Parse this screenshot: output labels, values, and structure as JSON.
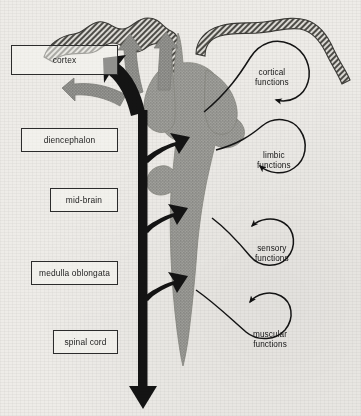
{
  "diagram": {
    "background_color": "#eeece8",
    "ink_color": "#1d1d1d",
    "grey_fill": "#9a9a96",
    "hatch_color": "#55544f"
  },
  "structure_labels": [
    {
      "id": "cortex",
      "text": "cortex",
      "x": 11,
      "y": 45,
      "w": 107,
      "h": 30
    },
    {
      "id": "diencephalon",
      "text": "diencephalon",
      "x": 21,
      "y": 128,
      "w": 97,
      "h": 24
    },
    {
      "id": "midbrain",
      "text": "mid-brain",
      "x": 50,
      "y": 188,
      "w": 68,
      "h": 24
    },
    {
      "id": "medulla-oblongata",
      "text": "medulla oblongata",
      "x": 31,
      "y": 261,
      "w": 87,
      "h": 24
    },
    {
      "id": "spinal-cord",
      "text": "spinal cord",
      "x": 53,
      "y": 330,
      "w": 65,
      "h": 24
    }
  ],
  "function_labels": [
    {
      "id": "cortical",
      "line1": "cortical",
      "line2": "functions",
      "x": 255,
      "y": 68
    },
    {
      "id": "limbic",
      "line1": "limbic",
      "line2": "functions",
      "x": 257,
      "y": 151
    },
    {
      "id": "sensory",
      "line1": "sensory",
      "line2": "functions",
      "x": 255,
      "y": 244
    },
    {
      "id": "muscular",
      "line1": "muscular",
      "line2": "functions",
      "x": 253,
      "y": 330
    }
  ],
  "flow_arrows": {
    "ascending_trunk": "black vertical arrow from spinal cord up to cortex",
    "descending_branches": 4,
    "grey_radiating_arrows": 3
  }
}
